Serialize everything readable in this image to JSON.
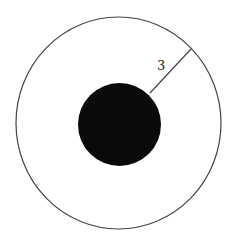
{
  "diagram": {
    "outer_circle": {
      "cx": 118.5,
      "cy": 123,
      "rx": 102.5,
      "ry": 106,
      "stroke": "#444444",
      "fill": "none"
    },
    "inner_circle": {
      "cx": 119.5,
      "cy": 124.5,
      "r": 41.5,
      "fill": "#0a0a0a"
    },
    "radius_segment": {
      "x1": 150,
      "y1": 93,
      "x2": 191,
      "y2": 49,
      "stroke": "#444444"
    },
    "label": {
      "text": "3",
      "x": 157,
      "y": 70
    }
  }
}
